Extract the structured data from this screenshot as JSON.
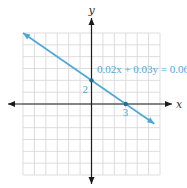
{
  "chart_data": {
    "type": "line",
    "title": "",
    "xlabel": "x",
    "ylabel": "y",
    "xlim": [
      -6,
      6
    ],
    "ylim": [
      -6,
      6
    ],
    "grid": true,
    "grid_step": 1,
    "series": [
      {
        "name": "0.02x + 0.03y = 0.06",
        "equation": "0.02x + 0.03y = 0.06",
        "slope": -0.6667,
        "intercept": 2,
        "x": [
          -6,
          5.5
        ],
        "y": [
          6,
          -1.6667
        ],
        "color": "#4aa8d8"
      }
    ],
    "points": [
      {
        "x": 0,
        "y": 2,
        "label": "2"
      },
      {
        "x": 3,
        "y": 0,
        "label": "3"
      }
    ],
    "annotations": [
      {
        "text": "0.02x + 0.03y = 0.06",
        "x": 3.1,
        "y": 2.6
      }
    ]
  }
}
